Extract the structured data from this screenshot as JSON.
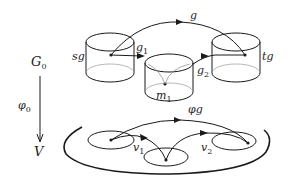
{
  "labels": {
    "G0": "G",
    "G0_sub": "0",
    "V": "V",
    "phi0": "φ",
    "phi0_sub": "0",
    "sg": "sg",
    "tg": "tg",
    "g": "g",
    "g1": "g",
    "g1_sub": "1",
    "g2": "g",
    "g2_sub": "2",
    "m1": "m",
    "m1_sub": "1",
    "phig": "φg",
    "v1": "v",
    "v1_sub": "1",
    "v2": "v",
    "v2_sub": "2"
  },
  "colors": {
    "stroke": "#1a1a1a",
    "thin": "#777777"
  }
}
